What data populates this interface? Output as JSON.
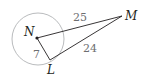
{
  "diagram": {
    "points": {
      "center": "N",
      "tangent_point": "L",
      "external_point": "M"
    },
    "segments": [
      {
        "from": "N",
        "to": "M",
        "label": "25"
      },
      {
        "from": "M",
        "to": "L",
        "label": "24"
      },
      {
        "from": "N",
        "to": "L",
        "label": "7"
      }
    ],
    "colors": {
      "circle": "#a7a9ac",
      "segment": "#231f20",
      "point_label": "#231f20",
      "length_label": "#6d6e70"
    }
  }
}
